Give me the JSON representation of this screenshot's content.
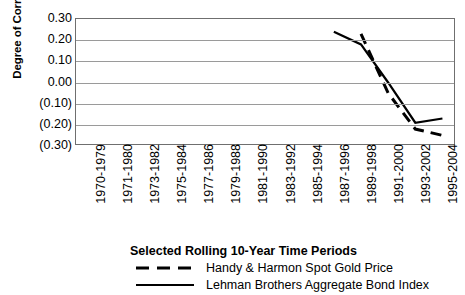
{
  "chart_data": {
    "type": "line",
    "title": "",
    "xlabel": "Selected Rolling 10-Year Time Periods",
    "ylabel": "Degree of Correlation",
    "ylim": [
      -0.3,
      0.3
    ],
    "ytick_values": [
      0.3,
      0.2,
      0.1,
      0.0,
      -0.1,
      -0.2,
      -0.3
    ],
    "ytick_labels": [
      "0.30",
      "0.20",
      "0.10",
      "0.00",
      "(0.10)",
      "(0.20)",
      "(0.30)"
    ],
    "grid": true,
    "legend_position": "bottom",
    "categories": [
      "1970-1979",
      "1971-1980",
      "1973-1982",
      "1975-1984",
      "1977-1986",
      "1979-1988",
      "1981-1990",
      "1983-1992",
      "1985-1994",
      "1987-1996",
      "1989-1998",
      "1991-2000",
      "1993-2002",
      "1995-2004"
    ],
    "series": [
      {
        "name": "Handy & Harmon Spot Gold Price",
        "style": "dashed",
        "color": "#000000",
        "values": [
          null,
          null,
          null,
          null,
          null,
          null,
          null,
          null,
          null,
          null,
          0.23,
          -0.05,
          -0.22,
          -0.25
        ]
      },
      {
        "name": "Lehman Brothers Aggregate Bond Index",
        "style": "solid",
        "color": "#000000",
        "values": [
          null,
          null,
          null,
          null,
          null,
          null,
          null,
          null,
          null,
          0.24,
          0.18,
          0.0,
          -0.19,
          -0.17
        ]
      }
    ]
  },
  "legend": {
    "title": "Selected Rolling 10-Year Time Periods",
    "entries": [
      {
        "label": "Handy & Harmon Spot Gold Price",
        "style": "dashed"
      },
      {
        "label": "Lehman Brothers Aggregate Bond Index",
        "style": "solid"
      }
    ]
  }
}
